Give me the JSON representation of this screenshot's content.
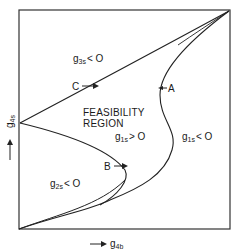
{
  "diagram": {
    "x_axis": {
      "label_main": "g",
      "label_sub": "4b",
      "arrow": "right-arrow"
    },
    "y_axis": {
      "label_main": "g",
      "label_sub": "4s",
      "arrow": "up-arrow"
    },
    "region_title_line1": "FEASIBILITY",
    "region_title_line2": "REGION",
    "constraints": [
      {
        "id": "g3s",
        "main": "g",
        "sub": "3s",
        "rel": "< O"
      },
      {
        "id": "g2s",
        "main": "g",
        "sub": "2s",
        "rel": "< O"
      },
      {
        "id": "g1s_pos",
        "main": "g",
        "sub": "1s",
        "rel": "> O"
      },
      {
        "id": "g1s_neg",
        "main": "g",
        "sub": "1s",
        "rel": "< O"
      }
    ],
    "points": [
      {
        "label": "A"
      },
      {
        "label": "B"
      },
      {
        "label": "C"
      }
    ]
  }
}
